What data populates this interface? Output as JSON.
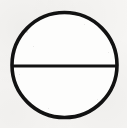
{
  "figure": {
    "title": "Circle with horizontal diameter",
    "medium": "scanned line drawing",
    "canvas": {
      "width": 127,
      "height": 128,
      "background_color": "#f6f5f3",
      "interior_color": "#fdfdfc"
    },
    "ink_color": "#111111",
    "shapes": [
      {
        "name": "circle-outline",
        "type": "circle",
        "center_x": 64.5,
        "center_y": 65,
        "radius": 52.5,
        "stroke_width": 3.6,
        "stroke_color": "#121212",
        "fill": "none"
      },
      {
        "name": "horizontal-diameter",
        "type": "line",
        "x1": 12,
        "y1": 66,
        "x2": 117,
        "y2": 66,
        "stroke_width": 3.1,
        "stroke_color": "#121212"
      }
    ],
    "speckles": [
      {
        "x": 26,
        "y": 31,
        "size": 2
      },
      {
        "x": 33,
        "y": 46,
        "size": 1
      },
      {
        "x": 97,
        "y": 99,
        "size": 1
      },
      {
        "x": 48,
        "y": 108,
        "size": 1
      },
      {
        "x": 84,
        "y": 24,
        "size": 1
      },
      {
        "x": 19,
        "y": 74,
        "size": 1
      },
      {
        "x": 108,
        "y": 52,
        "size": 1
      }
    ]
  }
}
